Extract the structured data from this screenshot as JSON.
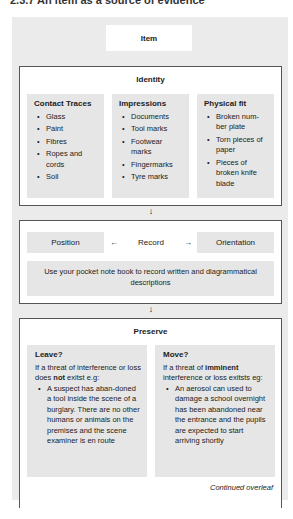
{
  "title": "2.3.7 An item as a source of evidence",
  "item": {
    "label": "Item"
  },
  "identity": {
    "title": "Identity",
    "columns": [
      {
        "heading": "Contact Traces",
        "items": [
          "Glass",
          "Paint",
          "Fibres",
          "Ropes and cords",
          "Soil"
        ]
      },
      {
        "heading": "Impressions",
        "items": [
          "Documents",
          "Tool marks",
          "Footwear marks",
          "Fingermarks",
          "Tyre marks"
        ]
      },
      {
        "heading": "Physical fit",
        "items": [
          "Broken num-ber plate",
          "Torn pieces of paper",
          "Pieces of broken knife blade"
        ]
      }
    ]
  },
  "arrows": {
    "down": "↓",
    "left": "←",
    "right": "→"
  },
  "record": {
    "position": "Position",
    "label": "Record",
    "orientation": "Orientation",
    "note": "Use your pocket note book to record written and diagrammatical descriptions"
  },
  "preserve": {
    "title": "Preserve",
    "leave": {
      "heading": "Leave?",
      "intro_pre": "If a threat of interference or loss does ",
      "intro_bold": "not",
      "intro_post": " exitst e.g:",
      "bullet": "A suspect has aban-doned a tool inside the scene of a burglary. There are no other humans or animals on the premises and the scene examiner is en route"
    },
    "move": {
      "heading": "Move?",
      "intro_pre": "If a threat of ",
      "intro_bold": "imminent",
      "intro_post": " interference or loss exitsts eg:",
      "bullet": "An aerosol can used to damage a school overnight has been abandoned near the entrance and the pupils are expected to start arriving shortly"
    },
    "continued": "Continued overleaf"
  }
}
